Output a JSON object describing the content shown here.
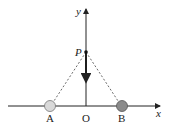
{
  "diagram": {
    "axes": {
      "x_label": "x",
      "y_label": "y",
      "origin_label": "O"
    },
    "points": {
      "P": {
        "label": "P",
        "description": "point on y-axis"
      },
      "A": {
        "label": "A",
        "description": "charge on x-axis left of origin",
        "fill": "#d9d9d9"
      },
      "B": {
        "label": "B",
        "description": "charge on x-axis right of origin",
        "fill": "#8a8a8a"
      }
    },
    "arrow": {
      "description": "force/velocity vector at P pointing down toward O"
    },
    "colors": {
      "line": "#222222",
      "dashed": "#444444"
    }
  }
}
